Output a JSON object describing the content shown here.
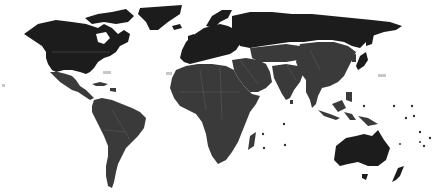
{
  "map": {
    "type": "world-choropleth",
    "projection": "equirectangular",
    "background": "#ffffff",
    "colors": {
      "category_dark": "#1c1c1c",
      "category_mid": "#3a3a3a",
      "borders": "#6a6a6a"
    },
    "regions": [
      {
        "name": "North America (Canada, USA)",
        "category": "dark"
      },
      {
        "name": "Greenland",
        "category": "dark"
      },
      {
        "name": "Mexico & Central America",
        "category": "mid"
      },
      {
        "name": "Caribbean",
        "category": "mid"
      },
      {
        "name": "South America",
        "category": "mid"
      },
      {
        "name": "Europe",
        "category": "dark"
      },
      {
        "name": "Russia",
        "category": "dark"
      },
      {
        "name": "Africa",
        "category": "mid"
      },
      {
        "name": "Middle East",
        "category": "mid"
      },
      {
        "name": "Central Asia",
        "category": "mid"
      },
      {
        "name": "South Asia",
        "category": "mid"
      },
      {
        "name": "China & East Asia",
        "category": "mid"
      },
      {
        "name": "Japan",
        "category": "dark"
      },
      {
        "name": "Southeast Asia",
        "category": "mid"
      },
      {
        "name": "Madagascar",
        "category": "mid"
      },
      {
        "name": "Australia",
        "category": "dark"
      },
      {
        "name": "New Zealand",
        "category": "dark"
      },
      {
        "name": "Pacific Islands",
        "category": "mid"
      }
    ],
    "ocean_labels_legible": false
  }
}
